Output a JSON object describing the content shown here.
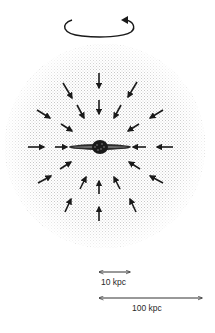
{
  "diagram": {
    "type": "galaxy infall schematic",
    "colors": {
      "background": "#ffffff",
      "halo_stipple": "#b8b8b8",
      "ink": "#1a1a1a"
    },
    "rotation_indicator": {
      "icon": "rotation-arrow-icon",
      "direction": "counter-clockwise"
    },
    "halo": {
      "cx": 105,
      "cy": 146,
      "rx": 100,
      "ry": 102
    },
    "galaxy": {
      "cx": 100,
      "cy": 147,
      "disk_half_width": 31,
      "bulge_radius": 7
    },
    "infall_arrows": [
      {
        "x1": 99,
        "y1": 73,
        "x2": 99,
        "y2": 88
      },
      {
        "x1": 63,
        "y1": 83,
        "x2": 72,
        "y2": 98
      },
      {
        "x1": 137,
        "y1": 82,
        "x2": 128,
        "y2": 97
      },
      {
        "x1": 99,
        "y1": 100,
        "x2": 99,
        "y2": 114
      },
      {
        "x1": 77,
        "y1": 105,
        "x2": 84,
        "y2": 118
      },
      {
        "x1": 121,
        "y1": 105,
        "x2": 114,
        "y2": 118
      },
      {
        "x1": 37,
        "y1": 110,
        "x2": 50,
        "y2": 118
      },
      {
        "x1": 163,
        "y1": 110,
        "x2": 150,
        "y2": 118
      },
      {
        "x1": 61,
        "y1": 124,
        "x2": 72,
        "y2": 131
      },
      {
        "x1": 139,
        "y1": 124,
        "x2": 128,
        "y2": 131
      },
      {
        "x1": 28,
        "y1": 147,
        "x2": 44,
        "y2": 147
      },
      {
        "x1": 55,
        "y1": 147,
        "x2": 67,
        "y2": 147
      },
      {
        "x1": 146,
        "y1": 147,
        "x2": 133,
        "y2": 147
      },
      {
        "x1": 173,
        "y1": 147,
        "x2": 157,
        "y2": 147
      },
      {
        "x1": 60,
        "y1": 169,
        "x2": 71,
        "y2": 162
      },
      {
        "x1": 140,
        "y1": 169,
        "x2": 129,
        "y2": 162
      },
      {
        "x1": 38,
        "y1": 183,
        "x2": 51,
        "y2": 176
      },
      {
        "x1": 163,
        "y1": 183,
        "x2": 150,
        "y2": 176
      },
      {
        "x1": 80,
        "y1": 189,
        "x2": 86,
        "y2": 177
      },
      {
        "x1": 99,
        "y1": 194,
        "x2": 99,
        "y2": 181
      },
      {
        "x1": 120,
        "y1": 189,
        "x2": 114,
        "y2": 177
      },
      {
        "x1": 65,
        "y1": 212,
        "x2": 71,
        "y2": 199
      },
      {
        "x1": 136,
        "y1": 212,
        "x2": 130,
        "y2": 199
      },
      {
        "x1": 99,
        "y1": 221,
        "x2": 99,
        "y2": 207
      }
    ],
    "scale_bars": [
      {
        "label": "10 kpc",
        "x1": 99,
        "x2": 130,
        "y": 272,
        "label_x": 101,
        "label_y": 278
      },
      {
        "label": "100 kpc",
        "x1": 99,
        "x2": 202,
        "y": 298,
        "label_x": 132,
        "label_y": 304
      }
    ]
  }
}
